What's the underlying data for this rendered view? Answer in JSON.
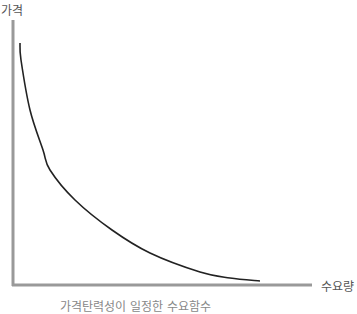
{
  "chart_data": {
    "type": "line",
    "title": "",
    "caption": "가격탄력성이 일정한 수요함수",
    "xlabel": "수요량",
    "ylabel": "가격",
    "xticks": [],
    "yticks": [],
    "grid": false,
    "legend": null,
    "series": [
      {
        "name": "수요곡선",
        "description": "Downward-sloping, convex demand curve (constant price elasticity)",
        "color": "#222222",
        "points_px": [
          [
            20,
            43
          ],
          [
            21,
            60
          ],
          [
            30,
            110
          ],
          [
            43,
            150
          ],
          [
            50,
            170
          ],
          [
            75,
            200
          ],
          [
            112,
            230
          ],
          [
            150,
            253
          ],
          [
            200,
            272
          ],
          [
            230,
            278
          ],
          [
            260,
            281
          ]
        ]
      }
    ],
    "axes": {
      "color": "#999999",
      "origin_px": [
        13,
        285
      ],
      "y_top_px": 20,
      "x_end_px": 312
    }
  }
}
